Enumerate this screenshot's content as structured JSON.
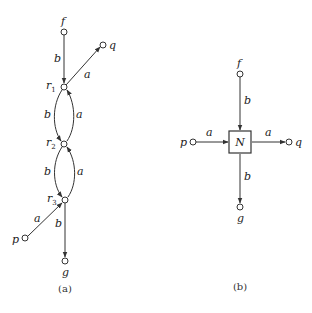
{
  "panel_a": {
    "caption": "(a)",
    "nodes": {
      "f": "f",
      "q": "q",
      "r1": "r",
      "r1_sub": "1",
      "r2": "r",
      "r2_sub": "2",
      "r3": "r",
      "r3_sub": "3",
      "p": "p",
      "g": "g"
    },
    "edges": {
      "f_r1": "b",
      "r1_q": "a",
      "r1_r2_left": "b",
      "r2_r1_right": "a",
      "r2_r3_left": "b",
      "r3_r2_right": "a",
      "p_r3": "a",
      "r3_g": "b"
    }
  },
  "panel_b": {
    "caption": "(b)",
    "box_label": "N",
    "nodes": {
      "f": "f",
      "p": "p",
      "q": "q",
      "g": "g"
    },
    "edges": {
      "f_N": "b",
      "p_N": "a",
      "N_q": "a",
      "N_g": "b"
    }
  }
}
